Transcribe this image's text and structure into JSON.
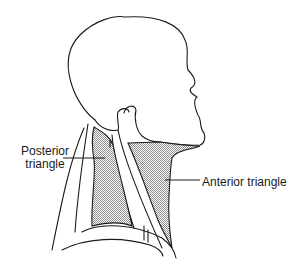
{
  "figure": {
    "labels": [
      {
        "id": "posterior",
        "text_line1": "Posterior",
        "text_line2": "triangle"
      },
      {
        "id": "anterior",
        "text": "Anterior triangle"
      }
    ],
    "colors": {
      "line": "#1a1a1a",
      "shading": "#9a9a9a",
      "background": "#ffffff"
    }
  }
}
